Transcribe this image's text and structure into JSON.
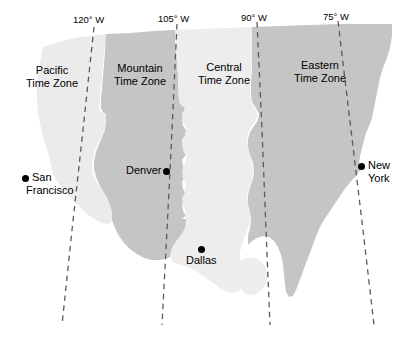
{
  "figure": {
    "type": "map",
    "background_color": "#ffffff"
  },
  "colors": {
    "pacific_fill": "#ebebeb",
    "mountain_fill": "#c5c5c5",
    "central_fill": "#ededed",
    "eastern_fill": "#c5c5c5",
    "line_color": "#5a5a5a",
    "text_color": "#000000",
    "marker_color": "#000000"
  },
  "zones": [
    {
      "id": "pacific",
      "line1": "Pacific",
      "line2": "Time Zone",
      "fill": "#ebebeb"
    },
    {
      "id": "mountain",
      "line1": "Mountain",
      "line2": "Time Zone",
      "fill": "#c5c5c5"
    },
    {
      "id": "central",
      "line1": "Central",
      "line2": "Time Zone",
      "fill": "#ededed"
    },
    {
      "id": "eastern",
      "line1": "Eastern",
      "line2": "Time Zone",
      "fill": "#c5c5c5"
    }
  ],
  "longitudes": [
    {
      "id": "120w",
      "value": "120",
      "degree": "°",
      "hemisphere": "W",
      "label": "120° W"
    },
    {
      "id": "105w",
      "value": "105",
      "degree": "°",
      "hemisphere": "W",
      "label": "105° W"
    },
    {
      "id": "90w",
      "value": "90",
      "degree": "°",
      "hemisphere": "W",
      "label": "90° W"
    },
    {
      "id": "75w",
      "value": "75",
      "degree": "°",
      "hemisphere": "W",
      "label": "75° W"
    }
  ],
  "cities": [
    {
      "id": "san-francisco",
      "line1": "San",
      "line2": "Francisco",
      "zone": "Pacific"
    },
    {
      "id": "denver",
      "line1": "Denver",
      "line2": "",
      "zone": "Mountain"
    },
    {
      "id": "dallas",
      "line1": "Dallas",
      "line2": "",
      "zone": "Central"
    },
    {
      "id": "new-york",
      "line1": "New",
      "line2": "York",
      "zone": "Eastern"
    }
  ]
}
